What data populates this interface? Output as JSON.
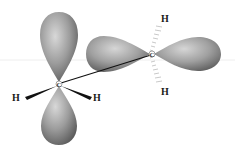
{
  "diagram": {
    "carbons": [
      {
        "label": "C",
        "x": 59,
        "y": 84,
        "orbital": "vertical p orbital"
      },
      {
        "label": "C",
        "x": 152,
        "y": 54,
        "orbital": "horizontal p orbital"
      }
    ],
    "hydrogens": [
      {
        "label": "H",
        "x": 17,
        "y": 100,
        "bond": "wedge"
      },
      {
        "label": "H",
        "x": 97,
        "y": 100,
        "bond": "wedge"
      },
      {
        "label": "H",
        "x": 165,
        "y": 21,
        "bond": "hashed"
      },
      {
        "label": "H",
        "x": 165,
        "y": 94,
        "bond": "hashed"
      }
    ],
    "colors": {
      "lobe_light": "#d4d4d4",
      "lobe_dark": "#6e6e6e",
      "bond": "#111111",
      "background": "#ffffff"
    }
  }
}
